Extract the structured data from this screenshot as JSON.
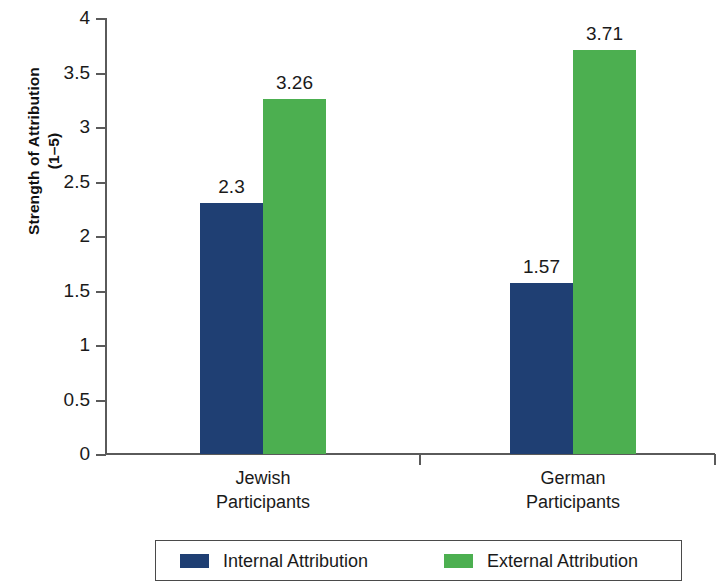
{
  "chart_data": {
    "type": "bar",
    "title": "",
    "xlabel": "",
    "ylabel": "Strength of Attribution (1–5)",
    "ylabel_line1": "Strength of Attribution",
    "ylabel_line2": "(1–5)",
    "categories": [
      "Jewish Participants",
      "German Participants"
    ],
    "category_lines": [
      [
        "Jewish",
        "Participants"
      ],
      [
        "German",
        "Participants"
      ]
    ],
    "series": [
      {
        "name": "Internal Attribution",
        "color": "#1F3F73",
        "values": [
          2.3,
          1.57
        ],
        "value_labels": [
          "2.3",
          "1.57"
        ]
      },
      {
        "name": "External Attribution",
        "color": "#4CAF50",
        "values": [
          3.26,
          3.71
        ],
        "value_labels": [
          "3.26",
          "3.71"
        ]
      }
    ],
    "ylim": [
      0,
      4
    ],
    "ytick_step": 0.5,
    "ytick_labels": [
      "4",
      "3.5",
      "3",
      "2.5",
      "2",
      "1.5",
      "1",
      "0.5",
      "0"
    ],
    "ytick_values": [
      4,
      3.5,
      3,
      2.5,
      2,
      1.5,
      1,
      0.5,
      0
    ],
    "grid": false,
    "legend_position": "bottom"
  },
  "legend": {
    "entries": [
      {
        "label": "Internal Attribution",
        "color": "#1F3F73"
      },
      {
        "label": "External Attribution",
        "color": "#4CAF50"
      }
    ]
  },
  "colors": {
    "internal": "#1F3F73",
    "external": "#4CAF50",
    "axis": "#5a5a5a",
    "text": "#1a1a1a",
    "background": "#ffffff"
  }
}
